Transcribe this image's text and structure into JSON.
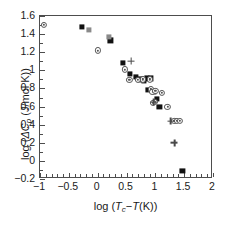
{
  "chart_data": {
    "type": "scatter",
    "title": "",
    "xlabel": "log (Tc-T(K))",
    "ylabel": "log (ΔCp (J/mol K))",
    "xlim": [
      -1,
      2
    ],
    "ylim": [
      -0.2,
      1.6
    ],
    "xticks": [
      -1,
      -0.5,
      0,
      0.5,
      1,
      1.5,
      2
    ],
    "xticklabels": [
      "−1",
      "−0.5",
      "0",
      "0.5",
      "1",
      "1.5",
      "2"
    ],
    "yticks": [
      -0.2,
      0,
      0.2,
      0.4,
      0.6,
      0.8,
      1,
      1.2,
      1.4,
      1.6
    ],
    "yticklabels": [
      "−0.2",
      "0",
      "0.2",
      "0.4",
      "0.6",
      "0.8",
      "1",
      "1.2",
      "1.4",
      "1.6"
    ],
    "grid": false,
    "legend": "none",
    "minor_ticks": true,
    "series": [
      {
        "name": "filled-square",
        "marker": "square",
        "color": "#111111",
        "points": [
          [
            -0.27,
            1.48
          ],
          [
            0.22,
            1.33
          ],
          [
            0.44,
            1.08
          ],
          [
            0.56,
            0.96
          ],
          [
            0.67,
            0.93
          ],
          [
            0.74,
            0.9
          ],
          [
            0.8,
            0.88
          ],
          [
            0.86,
            0.91
          ],
          [
            0.93,
            0.91
          ],
          [
            0.88,
            0.78
          ],
          [
            0.97,
            0.76
          ],
          [
            1.03,
            0.68
          ],
          [
            1.07,
            0.6
          ],
          [
            1.47,
            -0.11
          ]
        ]
      },
      {
        "name": "gray-square",
        "marker": "square-gray",
        "color": "#8a8a8a",
        "points": [
          [
            -0.15,
            1.45
          ],
          [
            0.2,
            1.37
          ]
        ]
      },
      {
        "name": "dotted-circle",
        "marker": "circle",
        "color": "#545454",
        "points": [
          [
            -0.93,
            1.5
          ],
          [
            0.0,
            1.22
          ],
          [
            0.47,
            1.01
          ],
          [
            0.55,
            0.89
          ],
          [
            0.7,
            0.89
          ],
          [
            0.78,
            0.9
          ],
          [
            0.9,
            0.9
          ],
          [
            0.92,
            0.79
          ],
          [
            0.95,
            0.76
          ],
          [
            1.0,
            0.77
          ],
          [
            0.99,
            0.65
          ],
          [
            0.96,
            0.64
          ],
          [
            1.12,
            0.75
          ],
          [
            1.21,
            0.6
          ],
          [
            1.33,
            0.44
          ],
          [
            1.38,
            0.44
          ],
          [
            1.42,
            0.44
          ]
        ]
      },
      {
        "name": "plus",
        "marker": "plus",
        "color": "#4a4a4a",
        "points": [
          [
            0.58,
            1.1
          ],
          [
            0.97,
            0.65
          ],
          [
            1.27,
            0.44
          ],
          [
            1.33,
            0.2
          ]
        ]
      }
    ]
  }
}
